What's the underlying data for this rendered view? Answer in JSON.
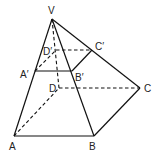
{
  "diagram": {
    "type": "pyramid-with-cross-section",
    "points": {
      "V": {
        "label": "V",
        "x": 52,
        "y": 19
      },
      "A": {
        "label": "A",
        "x": 14,
        "y": 136
      },
      "B": {
        "label": "B",
        "x": 94,
        "y": 136
      },
      "C": {
        "label": "C",
        "x": 140,
        "y": 88
      },
      "D": {
        "label": "D",
        "x": 59,
        "y": 88
      },
      "A1": {
        "label": "A′",
        "x": 35,
        "y": 71
      },
      "B1": {
        "label": "B′",
        "x": 72,
        "y": 71
      },
      "C1": {
        "label": "C′",
        "x": 92,
        "y": 50
      },
      "D1": {
        "label": "D′",
        "x": 56,
        "y": 50
      }
    },
    "labels": {
      "V": "V",
      "A": "A",
      "B": "B",
      "C": "C",
      "D": "D",
      "A1": "A′",
      "B1": "B′",
      "C1": "C′",
      "D1": "D′"
    },
    "solid_edges": [
      [
        "V",
        "A"
      ],
      [
        "V",
        "B"
      ],
      [
        "V",
        "C"
      ],
      [
        "A",
        "B"
      ],
      [
        "B",
        "C"
      ],
      [
        "A1",
        "B1"
      ],
      [
        "B1",
        "C1"
      ]
    ],
    "dashed_edges": [
      [
        "V",
        "D"
      ],
      [
        "A",
        "D"
      ],
      [
        "D",
        "C"
      ],
      [
        "A1",
        "D1"
      ],
      [
        "D1",
        "C1"
      ]
    ],
    "stroke_color": "#111111"
  }
}
